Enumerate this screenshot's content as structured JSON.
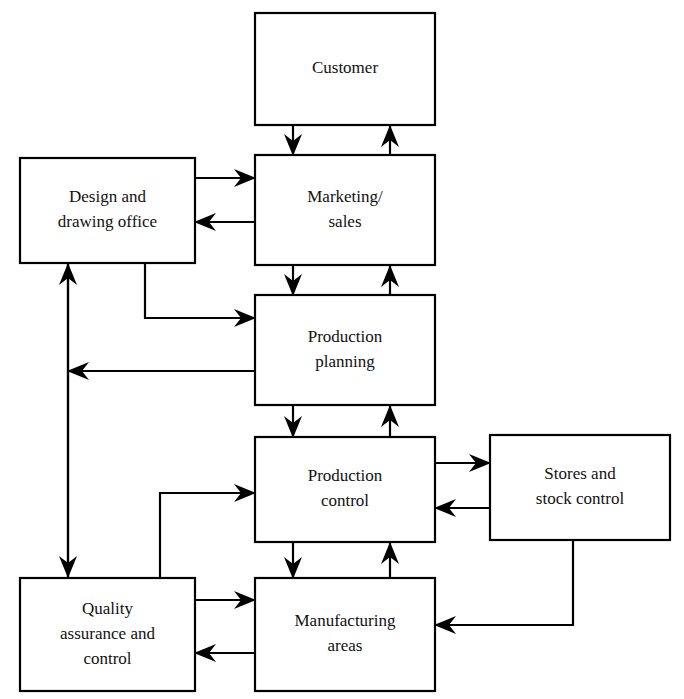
{
  "diagram": {
    "type": "flowchart",
    "background_color": "#ffffff",
    "line_color": "#000000",
    "text_color": "#111111",
    "nodes": [
      {
        "id": "customer",
        "name": "customer",
        "lines": [
          "Customer"
        ],
        "x": 255,
        "y": 13,
        "w": 180,
        "h": 112
      },
      {
        "id": "design",
        "name": "design-and-drawing-office",
        "lines": [
          "Design and",
          "drawing office"
        ],
        "x": 20,
        "y": 158,
        "w": 175,
        "h": 105
      },
      {
        "id": "marketing",
        "name": "marketing-sales",
        "lines": [
          "Marketing/",
          "sales"
        ],
        "x": 255,
        "y": 155,
        "w": 180,
        "h": 110
      },
      {
        "id": "planning",
        "name": "production-planning",
        "lines": [
          "Production",
          "planning"
        ],
        "x": 255,
        "y": 295,
        "w": 180,
        "h": 110
      },
      {
        "id": "control",
        "name": "production-control",
        "lines": [
          "Production",
          "control"
        ],
        "x": 255,
        "y": 437,
        "w": 180,
        "h": 105
      },
      {
        "id": "stores",
        "name": "stores-and-stock-control",
        "lines": [
          "Stores and",
          "stock control"
        ],
        "x": 490,
        "y": 435,
        "w": 180,
        "h": 105
      },
      {
        "id": "quality",
        "name": "quality-assurance-and-control",
        "lines": [
          "Quality",
          "assurance and",
          "control"
        ],
        "x": 20,
        "y": 578,
        "w": 175,
        "h": 113
      },
      {
        "id": "manufacturing",
        "name": "manufacturing-areas",
        "lines": [
          "Manufacturing",
          "areas"
        ],
        "x": 255,
        "y": 578,
        "w": 180,
        "h": 113
      }
    ],
    "edges": [
      {
        "id": "customer-to-marketing",
        "from": "customer",
        "to": "marketing",
        "path": "M293,125 L293,155",
        "arrow": "down",
        "tip_x": 293,
        "tip_y": 156
      },
      {
        "id": "marketing-to-customer",
        "from": "marketing",
        "to": "customer",
        "path": "M390,155 L390,126",
        "arrow": "up",
        "tip_x": 390,
        "tip_y": 125
      },
      {
        "id": "design-to-marketing",
        "from": "design",
        "to": "marketing",
        "path": "M195,178 L255,178",
        "arrow": "right",
        "tip_x": 256,
        "tip_y": 178
      },
      {
        "id": "marketing-to-design",
        "from": "marketing",
        "to": "design",
        "path": "M255,222 L196,222",
        "arrow": "left",
        "tip_x": 194,
        "tip_y": 222
      },
      {
        "id": "marketing-to-planning",
        "from": "marketing",
        "to": "planning",
        "path": "M293,265 L293,295",
        "arrow": "down",
        "tip_x": 293,
        "tip_y": 296
      },
      {
        "id": "planning-to-marketing",
        "from": "planning",
        "to": "marketing",
        "path": "M390,295 L390,266",
        "arrow": "up",
        "tip_x": 390,
        "tip_y": 265
      },
      {
        "id": "design-to-planning",
        "from": "design",
        "to": "planning",
        "path": "M145,263 L145,318 L255,318",
        "arrow": "right",
        "tip_x": 256,
        "tip_y": 318
      },
      {
        "id": "planning-to-design",
        "from": "planning",
        "to": "design",
        "path": "M255,371 L69,371",
        "arrow": "left",
        "tip_x": 67,
        "tip_y": 371
      },
      {
        "id": "design-quality-vertical-up",
        "from": "quality",
        "to": "design",
        "path": "M68,578 L68,264",
        "arrow": "up",
        "tip_x": 68,
        "tip_y": 263
      },
      {
        "id": "design-quality-vertical-down",
        "from": "design",
        "to": "quality",
        "path": "M68,264 L68,577",
        "arrow": "down",
        "tip_x": 68,
        "tip_y": 578
      },
      {
        "id": "planning-to-control",
        "from": "planning",
        "to": "control",
        "path": "M293,405 L293,437",
        "arrow": "down",
        "tip_x": 293,
        "tip_y": 438
      },
      {
        "id": "control-to-planning",
        "from": "control",
        "to": "planning",
        "path": "M390,437 L390,406",
        "arrow": "up",
        "tip_x": 390,
        "tip_y": 405
      },
      {
        "id": "control-to-stores",
        "from": "control",
        "to": "stores",
        "path": "M435,463 L490,463",
        "arrow": "right",
        "tip_x": 491,
        "tip_y": 463
      },
      {
        "id": "stores-to-control",
        "from": "stores",
        "to": "control",
        "path": "M490,508 L436,508",
        "arrow": "left",
        "tip_x": 434,
        "tip_y": 508
      },
      {
        "id": "control-to-manufacturing",
        "from": "control",
        "to": "manufacturing",
        "path": "M293,542 L293,578",
        "arrow": "down",
        "tip_x": 293,
        "tip_y": 579
      },
      {
        "id": "manufacturing-to-control",
        "from": "manufacturing",
        "to": "control",
        "path": "M390,578 L390,543",
        "arrow": "up",
        "tip_x": 390,
        "tip_y": 542
      },
      {
        "id": "quality-to-control",
        "from": "quality",
        "to": "control",
        "path": "M160,578 L160,493 L255,493",
        "arrow": "right",
        "tip_x": 256,
        "tip_y": 493
      },
      {
        "id": "quality-to-manufacturing",
        "from": "quality",
        "to": "manufacturing",
        "path": "M195,600 L255,600",
        "arrow": "right",
        "tip_x": 256,
        "tip_y": 600
      },
      {
        "id": "manufacturing-to-quality",
        "from": "manufacturing",
        "to": "quality",
        "path": "M255,653 L196,653",
        "arrow": "left",
        "tip_x": 194,
        "tip_y": 653
      },
      {
        "id": "stores-to-manufacturing",
        "from": "stores",
        "to": "manufacturing",
        "path": "M573,540 L573,625 L436,625",
        "arrow": "left",
        "tip_x": 434,
        "tip_y": 625
      }
    ]
  }
}
